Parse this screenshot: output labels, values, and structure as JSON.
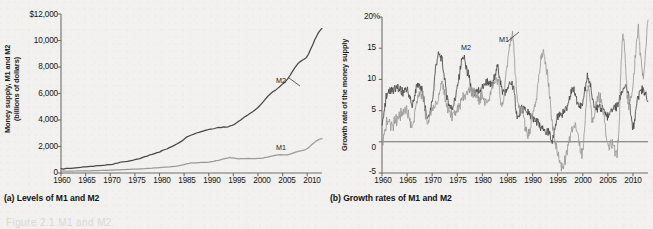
{
  "figure": {
    "background_color": "#f2f1ef",
    "m1_color": "#9a9a98",
    "m2_color": "#474746",
    "axis_color": "#6e6e6c"
  },
  "panel_a": {
    "caption": "(a) Levels of M1 and M2",
    "ylabel": "Money supply, M1 and M2\n(billions of dollars)",
    "yticks": [
      "$12,000",
      "10,000",
      "8,000",
      "6,000",
      "4,000",
      "2,000",
      "0"
    ],
    "xticks": [
      "1960",
      "1965",
      "1970",
      "1975",
      "1980",
      "1985",
      "1990",
      "1995",
      "2000",
      "2005",
      "2010"
    ],
    "series_labels": {
      "m2": "M2",
      "m1": "M1"
    }
  },
  "panel_b": {
    "caption": "(b) Growth rates of M1 and M2",
    "ylabel": "Growth rate of the money supply",
    "yticks": [
      "20%",
      "15",
      "10",
      "5",
      "0",
      "-5"
    ],
    "xticks": [
      "1960",
      "1965",
      "1970",
      "1975",
      "1980",
      "1985",
      "1990",
      "1995",
      "2000",
      "2005",
      "2010"
    ],
    "series_labels": {
      "m2": "M2",
      "m1": "M1"
    }
  },
  "bottom_ghost_text": "Figure 2.1  M1 and M2",
  "chart_data": [
    {
      "type": "line",
      "panel": "a",
      "title": "(a) Levels of M1 and M2",
      "xlabel": "",
      "ylabel": "Money supply, M1 and M2 (billions of dollars)",
      "xlim": [
        1960,
        2013
      ],
      "ylim": [
        0,
        12000
      ],
      "yticks": [
        0,
        2000,
        4000,
        6000,
        8000,
        10000,
        12000
      ],
      "xticks": [
        1960,
        1965,
        1970,
        1975,
        1980,
        1985,
        1990,
        1995,
        2000,
        2005,
        2010
      ],
      "grid": false,
      "legend": "inline-annotation",
      "x": [
        1960,
        1962,
        1964,
        1966,
        1968,
        1970,
        1972,
        1974,
        1976,
        1978,
        1980,
        1982,
        1984,
        1986,
        1988,
        1990,
        1992,
        1994,
        1995,
        1996,
        1998,
        2000,
        2002,
        2004,
        2006,
        2008,
        2009,
        2010,
        2011,
        2012,
        2013
      ],
      "series": [
        {
          "name": "M2",
          "color": "#474746",
          "values": [
            310,
            350,
            425,
            490,
            570,
            630,
            800,
            900,
            1100,
            1350,
            1600,
            1900,
            2300,
            2800,
            3070,
            3280,
            3430,
            3500,
            3650,
            3900,
            4400,
            4930,
            5800,
            6400,
            7070,
            8200,
            8500,
            8800,
            9600,
            10400,
            10900
          ]
        },
        {
          "name": "M1",
          "color": "#9a9a98",
          "values": [
            140,
            148,
            160,
            175,
            195,
            215,
            250,
            280,
            310,
            360,
            410,
            470,
            550,
            730,
            790,
            825,
            965,
            1150,
            1130,
            1080,
            1095,
            1090,
            1200,
            1370,
            1370,
            1600,
            1700,
            1840,
            2170,
            2450,
            2600
          ]
        }
      ]
    },
    {
      "type": "line",
      "panel": "b",
      "title": "(b) Growth rates of M1 and M2",
      "xlabel": "",
      "ylabel": "Growth rate of the money supply",
      "xlim": [
        1960,
        2013
      ],
      "ylim": [
        -5,
        20
      ],
      "yticks": [
        -5,
        0,
        5,
        10,
        15,
        20
      ],
      "xticks": [
        1960,
        1965,
        1970,
        1975,
        1980,
        1985,
        1990,
        1995,
        2000,
        2005,
        2010
      ],
      "grid": false,
      "zero_line": 0,
      "legend": "inline-annotation",
      "x": [
        1960,
        1961,
        1962,
        1963,
        1964,
        1965,
        1966,
        1967,
        1968,
        1969,
        1970,
        1971,
        1972,
        1973,
        1974,
        1975,
        1976,
        1977,
        1978,
        1979,
        1980,
        1981,
        1982,
        1983,
        1984,
        1985,
        1986,
        1987,
        1988,
        1989,
        1990,
        1991,
        1992,
        1993,
        1994,
        1995,
        1996,
        1997,
        1998,
        1999,
        2000,
        2001,
        2002,
        2003,
        2004,
        2005,
        2006,
        2007,
        2008,
        2009,
        2010,
        2011,
        2012,
        2013
      ],
      "series": [
        {
          "name": "M2",
          "color": "#474746",
          "values": [
            3.0,
            7.5,
            8.2,
            8.5,
            8.0,
            8.3,
            6.0,
            9.0,
            8.0,
            4.0,
            6.5,
            13.4,
            12.9,
            7.0,
            5.7,
            8.5,
            13.5,
            11.3,
            8.0,
            8.0,
            8.8,
            9.5,
            9.0,
            11.8,
            8.2,
            8.4,
            9.2,
            4.2,
            5.4,
            4.8,
            3.6,
            3.1,
            1.8,
            1.5,
            0.6,
            4.0,
            4.7,
            5.8,
            8.6,
            6.2,
            6.2,
            10.3,
            6.8,
            5.2,
            5.4,
            4.1,
            5.4,
            6.0,
            8.5,
            7.8,
            2.5,
            7.2,
            8.2,
            6.5
          ]
        },
        {
          "name": "M1",
          "color": "#9a9a98",
          "values": [
            -0.5,
            3.2,
            2.4,
            3.8,
            4.6,
            4.7,
            2.5,
            6.5,
            7.7,
            3.3,
            5.1,
            6.5,
            9.2,
            5.5,
            4.3,
            4.8,
            6.7,
            8.0,
            8.2,
            7.0,
            7.3,
            6.4,
            8.7,
            9.8,
            5.9,
            12.4,
            16.9,
            6.3,
            4.9,
            0.9,
            4.0,
            8.7,
            14.3,
            10.5,
            2.4,
            -1.6,
            -4.1,
            -1.2,
            2.2,
            1.6,
            -1.7,
            8.7,
            3.2,
            7.1,
            5.3,
            -0.3,
            -0.5,
            -0.7,
            17.0,
            6.5,
            9.0,
            17.8,
            10.5,
            19.5
          ]
        }
      ]
    }
  ]
}
